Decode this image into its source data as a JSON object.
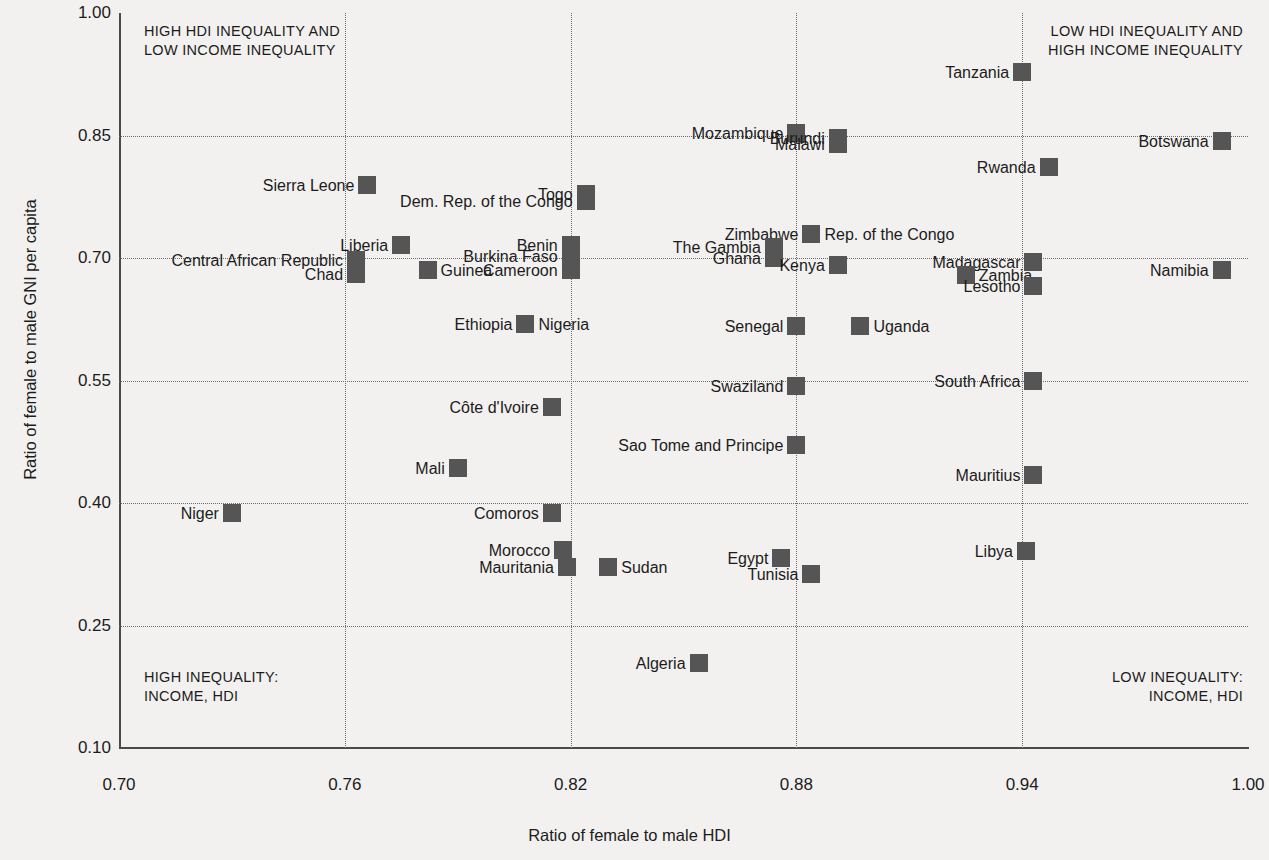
{
  "chart_data": {
    "type": "scatter",
    "title": "",
    "xlabel": "Ratio of female to male HDI",
    "ylabel": "Ratio of female to male GNI per capita",
    "xlim": [
      0.7,
      1.0
    ],
    "ylim": [
      0.1,
      1.0
    ],
    "xticks": [
      "0.70",
      "0.76",
      "0.82",
      "0.88",
      "0.94",
      "1.00"
    ],
    "xtick_values": [
      0.7,
      0.76,
      0.82,
      0.88,
      0.94,
      1.0
    ],
    "yticks": [
      "1.00",
      "0.85",
      "0.70",
      "0.55",
      "0.40",
      "0.25",
      "0.10"
    ],
    "ytick_values": [
      1.0,
      0.85,
      0.7,
      0.55,
      0.4,
      0.25,
      0.1
    ],
    "grid": "dotted",
    "legend": "none",
    "marker": "square",
    "marker_color": "#555555",
    "annotations": [
      {
        "id": "top-left",
        "text": "HIGH HDI INEQUALITY AND\nLOW INCOME INEQUALITY"
      },
      {
        "id": "top-right",
        "text": "LOW HDI INEQUALITY AND\nHIGH INCOME INEQUALITY"
      },
      {
        "id": "bottom-left",
        "text": "HIGH INEQUALITY:\nINCOME, HDI"
      },
      {
        "id": "bottom-right",
        "text": "LOW INEQUALITY:\nINCOME, HDI"
      }
    ],
    "points": [
      {
        "name": "Tanzania",
        "x": 0.94,
        "y": 0.928,
        "side": "left"
      },
      {
        "name": "Botswana",
        "x": 0.993,
        "y": 0.843,
        "side": "left"
      },
      {
        "name": "Mozambique",
        "x": 0.88,
        "y": 0.853,
        "side": "left"
      },
      {
        "name": "Burundi",
        "x": 0.891,
        "y": 0.847,
        "side": "left"
      },
      {
        "name": "Malawi",
        "x": 0.891,
        "y": 0.84,
        "side": "left"
      },
      {
        "name": "Rwanda",
        "x": 0.947,
        "y": 0.812,
        "side": "left"
      },
      {
        "name": "Sierra Leone",
        "x": 0.766,
        "y": 0.79,
        "side": "left"
      },
      {
        "name": "Togo",
        "x": 0.824,
        "y": 0.778,
        "side": "left"
      },
      {
        "name": "Dem. Rep. of the Congo",
        "x": 0.824,
        "y": 0.77,
        "side": "left"
      },
      {
        "name": "Zimbabwe",
        "x": 0.884,
        "y": 0.73,
        "side": "left"
      },
      {
        "name": "Rep. of the Congo",
        "x": 0.884,
        "y": 0.73,
        "side": "right"
      },
      {
        "name": "Liberia",
        "x": 0.775,
        "y": 0.716,
        "side": "left"
      },
      {
        "name": "Benin",
        "x": 0.82,
        "y": 0.716,
        "side": "left"
      },
      {
        "name": "The Gambia",
        "x": 0.874,
        "y": 0.714,
        "side": "left"
      },
      {
        "name": "Burkina Faso",
        "x": 0.82,
        "y": 0.702,
        "side": "left"
      },
      {
        "name": "Ghana",
        "x": 0.874,
        "y": 0.7,
        "side": "left"
      },
      {
        "name": "Central African Republic",
        "x": 0.763,
        "y": 0.697,
        "side": "left"
      },
      {
        "name": "Madagascar",
        "x": 0.943,
        "y": 0.695,
        "side": "left"
      },
      {
        "name": "Kenya",
        "x": 0.891,
        "y": 0.691,
        "side": "left"
      },
      {
        "name": "Cameroon",
        "x": 0.82,
        "y": 0.685,
        "side": "left"
      },
      {
        "name": "Namibia",
        "x": 0.993,
        "y": 0.685,
        "side": "left"
      },
      {
        "name": "Chad",
        "x": 0.763,
        "y": 0.68,
        "side": "left"
      },
      {
        "name": "Guinea",
        "x": 0.782,
        "y": 0.685,
        "side": "right"
      },
      {
        "name": "Zambia",
        "x": 0.925,
        "y": 0.679,
        "side": "right"
      },
      {
        "name": "Lesotho",
        "x": 0.943,
        "y": 0.666,
        "side": "left"
      },
      {
        "name": "Ethiopia",
        "x": 0.808,
        "y": 0.619,
        "side": "left"
      },
      {
        "name": "Nigeria",
        "x": 0.808,
        "y": 0.619,
        "side": "right"
      },
      {
        "name": "Senegal",
        "x": 0.88,
        "y": 0.617,
        "side": "left"
      },
      {
        "name": "Uganda",
        "x": 0.897,
        "y": 0.617,
        "side": "right"
      },
      {
        "name": "Swaziland",
        "x": 0.88,
        "y": 0.543,
        "side": "left"
      },
      {
        "name": "South Africa",
        "x": 0.943,
        "y": 0.55,
        "side": "left"
      },
      {
        "name": "Côte d'Ivoire",
        "x": 0.815,
        "y": 0.518,
        "side": "left"
      },
      {
        "name": "Sao Tome and Principe",
        "x": 0.88,
        "y": 0.471,
        "side": "left"
      },
      {
        "name": "Mali",
        "x": 0.79,
        "y": 0.443,
        "side": "left"
      },
      {
        "name": "Mauritius",
        "x": 0.943,
        "y": 0.434,
        "side": "left"
      },
      {
        "name": "Niger",
        "x": 0.73,
        "y": 0.388,
        "side": "left"
      },
      {
        "name": "Comoros",
        "x": 0.815,
        "y": 0.388,
        "side": "left"
      },
      {
        "name": "Morocco",
        "x": 0.818,
        "y": 0.342,
        "side": "left"
      },
      {
        "name": "Libya",
        "x": 0.941,
        "y": 0.341,
        "side": "left"
      },
      {
        "name": "Mauritania",
        "x": 0.819,
        "y": 0.322,
        "side": "left"
      },
      {
        "name": "Sudan",
        "x": 0.83,
        "y": 0.322,
        "side": "right"
      },
      {
        "name": "Egypt",
        "x": 0.876,
        "y": 0.333,
        "side": "left"
      },
      {
        "name": "Tunisia",
        "x": 0.884,
        "y": 0.313,
        "side": "left"
      },
      {
        "name": "Algeria",
        "x": 0.854,
        "y": 0.204,
        "side": "left"
      }
    ]
  }
}
